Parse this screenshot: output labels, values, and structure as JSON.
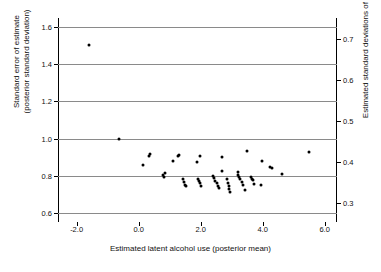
{
  "chart_data": {
    "type": "scatter",
    "title": "",
    "xlabel": "Estimated latent alcohol use (posterior mean)",
    "ylabel": "Standard error of estimate (posterior standard deviation)",
    "ylabel_line1": "Standard error of estimate",
    "ylabel_line2": "(posterior standard deviation)",
    "ylabel_right": "Estimated standard deviations of θ",
    "xlim": [
      -2.6,
      6.4
    ],
    "ylim": [
      0.55,
      1.65
    ],
    "ylim_right": [
      0.2525,
      0.7525
    ],
    "xticks": [
      -2.0,
      0.0,
      2.0,
      4.0,
      6.0
    ],
    "xticklabels": [
      "-2.0",
      "0.0",
      "2.0",
      "4.0",
      "6.0"
    ],
    "yticks": [
      0.6,
      0.8,
      1.0,
      1.2,
      1.4,
      1.6
    ],
    "yticklabels": [
      "0.6",
      "0.8",
      "1.0",
      "1.2",
      "1.4",
      "1.6"
    ],
    "yticks_right": [
      0.3,
      0.4,
      0.5,
      0.6,
      0.7
    ],
    "yticklabels_right": [
      "0.3",
      "0.4",
      "0.5",
      "0.6",
      "0.7"
    ],
    "grid": "horizontal",
    "legend": "none",
    "marker": "filled-circle",
    "marker_color": "#000000",
    "gridline_color": "#8a8a8a",
    "points": [
      [
        -1.6,
        1.505
      ],
      [
        -0.63,
        1.0
      ],
      [
        0.13,
        0.855
      ],
      [
        0.33,
        0.905
      ],
      [
        0.36,
        0.915
      ],
      [
        0.8,
        0.805
      ],
      [
        0.82,
        0.79
      ],
      [
        0.84,
        0.812
      ],
      [
        1.1,
        0.878
      ],
      [
        1.26,
        0.908
      ],
      [
        1.3,
        0.912
      ],
      [
        1.42,
        0.78
      ],
      [
        1.46,
        0.768
      ],
      [
        1.5,
        0.752
      ],
      [
        1.53,
        0.742
      ],
      [
        1.88,
        0.875
      ],
      [
        1.97,
        0.905
      ],
      [
        1.9,
        0.78
      ],
      [
        1.94,
        0.77
      ],
      [
        1.98,
        0.758
      ],
      [
        2.02,
        0.745
      ],
      [
        2.4,
        0.798
      ],
      [
        2.44,
        0.785
      ],
      [
        2.48,
        0.772
      ],
      [
        2.52,
        0.76
      ],
      [
        2.56,
        0.745
      ],
      [
        2.58,
        0.735
      ],
      [
        2.68,
        0.898
      ],
      [
        2.7,
        0.825
      ],
      [
        2.86,
        0.782
      ],
      [
        2.88,
        0.762
      ],
      [
        2.9,
        0.745
      ],
      [
        2.92,
        0.73
      ],
      [
        2.94,
        0.712
      ],
      [
        3.2,
        0.818
      ],
      [
        3.22,
        0.805
      ],
      [
        3.24,
        0.795
      ],
      [
        3.28,
        0.782
      ],
      [
        3.32,
        0.768
      ],
      [
        3.36,
        0.752
      ],
      [
        3.42,
        0.722
      ],
      [
        3.5,
        0.935
      ],
      [
        3.62,
        0.79
      ],
      [
        3.66,
        0.782
      ],
      [
        3.7,
        0.775
      ],
      [
        3.72,
        0.755
      ],
      [
        3.98,
        0.878
      ],
      [
        3.96,
        0.752
      ],
      [
        4.24,
        0.848
      ],
      [
        4.3,
        0.842
      ],
      [
        4.62,
        0.808
      ],
      [
        5.5,
        0.93
      ]
    ]
  }
}
